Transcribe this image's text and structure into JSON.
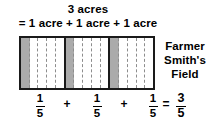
{
  "diagram": {
    "heading": {
      "line1": "3 acres",
      "line2": "= 1 acre + 1 acre + 1 acre"
    },
    "field_label": {
      "line1": "Farmer",
      "line2": "Smith's",
      "line3": "Field"
    },
    "field": {
      "acres": 3,
      "cells_per_acre": 5,
      "shaded_cells_per_acre": 1,
      "shaded_color": "#ababab",
      "unshaded_color": "#ffffff",
      "border_color": "#1a1a1a",
      "divider_color": "#8d8d8d"
    },
    "equation": {
      "term1": {
        "numerator": "1",
        "denominator": "5"
      },
      "operator1": "+",
      "term2": {
        "numerator": "1",
        "denominator": "5"
      },
      "operator2": "+",
      "term3": {
        "numerator": "1",
        "denominator": "5"
      },
      "equals": "=",
      "result": {
        "numerator": "3",
        "denominator": "5"
      }
    }
  }
}
